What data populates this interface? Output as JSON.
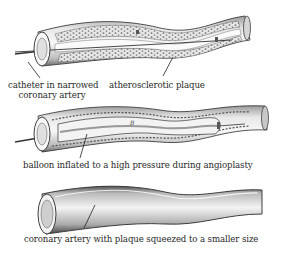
{
  "diagram": {
    "colors": {
      "ink": "#2b2b2b",
      "vessel_fill": "#f2f2f2",
      "plaque_fill": "#dcdcdc",
      "shade": "#8a8a8a",
      "background": "#ffffff"
    },
    "panels": [
      {
        "id": "stage-1",
        "labels": [
          {
            "text_line1": "catheter in narrowed",
            "text_line2": "coronary artery"
          },
          {
            "text": "atherosclerotic plaque"
          }
        ]
      },
      {
        "id": "stage-2",
        "labels": [
          {
            "text": "balloon inflated to a high pressure during angioplasty"
          }
        ],
        "balloon_marker": "B"
      },
      {
        "id": "stage-3",
        "labels": [
          {
            "text": "coronary artery with plaque squeezed to a smaller size"
          }
        ]
      }
    ]
  }
}
